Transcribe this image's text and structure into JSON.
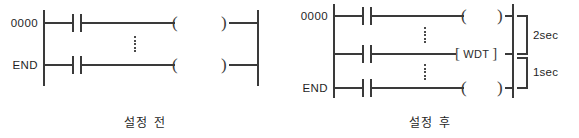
{
  "figure": {
    "ink_color": "#3a3a3a",
    "background_color": "#ffffff"
  },
  "panels": [
    {
      "id": "before",
      "caption": "설정 전",
      "row_labels": [
        "0000",
        "END"
      ],
      "rungs": [
        {
          "label": "0000",
          "contact": "normally-open",
          "coil_open": "(",
          "coil_close": ")"
        },
        {
          "label": "END",
          "contact": "normally-open",
          "coil_open": "(",
          "coil_close": ")"
        }
      ],
      "ellipsis_count": 1
    },
    {
      "id": "after",
      "caption": "설정 후",
      "row_labels": [
        "0000",
        "",
        "END"
      ],
      "rungs": [
        {
          "label": "0000",
          "contact": "normally-open",
          "coil_open": "(",
          "coil_close": ")"
        },
        {
          "label": "",
          "contact": "normally-open",
          "instruction": "WDT",
          "bracket_open": "[",
          "bracket_close": "]"
        },
        {
          "label": "END",
          "contact": "normally-open",
          "coil_open": "(",
          "coil_close": ")"
        }
      ],
      "ellipsis_count": 2,
      "scan_spans": [
        {
          "label": "2sec"
        },
        {
          "label": "1sec"
        }
      ]
    }
  ]
}
